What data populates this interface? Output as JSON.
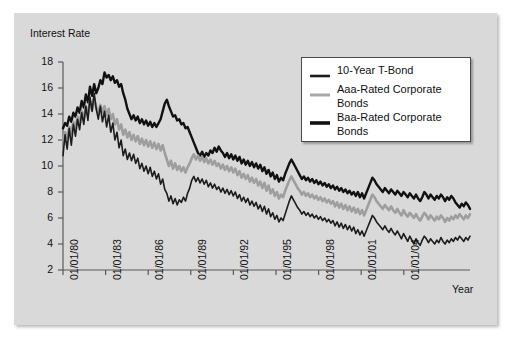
{
  "chart_data": {
    "type": "line",
    "title": "",
    "xlabel": "Year",
    "ylabel": "Interest Rate",
    "ylim": [
      2,
      18
    ],
    "yticks": [
      2,
      4,
      6,
      8,
      10,
      12,
      14,
      16,
      18
    ],
    "xticks": [
      "01/01/80",
      "01/01/83",
      "01/01/86",
      "01/01/89",
      "01/01/92",
      "01/01/95",
      "01/01/98",
      "01/01/01",
      "01/01/04"
    ],
    "xlim": [
      "01/01/80",
      "01/01/06"
    ],
    "grid": false,
    "legend_position": "upper-right-inside",
    "colors": {
      "t_bond": "#1c1c1c",
      "aaa": "#9e9e9e",
      "baa": "#111111",
      "panel_background": "#d9d9d9",
      "page_background": "#ffffff",
      "axis": "#5a5a5a"
    },
    "series": [
      {
        "name": "10-Year T-Bond",
        "color": "#1c1c1c",
        "width": 1.6,
        "values": [
          10.8,
          12.4,
          11.3,
          12.9,
          11.6,
          13.2,
          12.3,
          13.6,
          12.8,
          14.1,
          13.2,
          14.6,
          13.5,
          15.3,
          14.2,
          15.6,
          14.4,
          13.6,
          14.6,
          13.4,
          14.2,
          13.0,
          13.9,
          12.6,
          13.3,
          12.0,
          12.6,
          11.4,
          12.0,
          10.8,
          11.3,
          10.5,
          11.0,
          10.4,
          10.9,
          10.2,
          10.6,
          9.8,
          10.2,
          9.6,
          10.0,
          9.4,
          9.9,
          9.2,
          9.6,
          9.0,
          9.4,
          8.6,
          9.0,
          8.2,
          7.9,
          7.3,
          7.7,
          7.1,
          7.5,
          7.0,
          7.4,
          7.2,
          7.6,
          7.3,
          7.9,
          8.3,
          8.9,
          9.2,
          8.8,
          9.1,
          8.7,
          9.0,
          8.6,
          8.9,
          8.4,
          8.7,
          8.3,
          8.6,
          8.2,
          8.4,
          8.0,
          8.3,
          7.9,
          8.2,
          7.8,
          8.1,
          7.7,
          8.0,
          7.5,
          7.8,
          7.3,
          7.6,
          7.2,
          7.5,
          7.0,
          7.3,
          6.9,
          7.2,
          6.7,
          7.0,
          6.5,
          6.9,
          6.3,
          6.7,
          6.1,
          6.4,
          5.9,
          6.2,
          5.7,
          6.0,
          5.8,
          6.3,
          6.8,
          7.3,
          7.7,
          7.4,
          7.1,
          6.8,
          6.6,
          6.3,
          6.5,
          6.2,
          6.4,
          6.1,
          6.3,
          6.0,
          6.2,
          5.9,
          6.1,
          5.8,
          6.0,
          5.7,
          5.9,
          5.6,
          5.8,
          5.4,
          5.7,
          5.3,
          5.6,
          5.2,
          5.5,
          5.1,
          5.4,
          5.0,
          5.3,
          4.8,
          5.1,
          4.7,
          5.0,
          4.6,
          5.0,
          5.4,
          5.8,
          6.2,
          6.0,
          5.7,
          5.5,
          5.3,
          5.1,
          5.4,
          5.1,
          4.9,
          5.2,
          4.9,
          4.7,
          5.0,
          4.7,
          4.4,
          4.8,
          4.5,
          4.2,
          4.6,
          4.3,
          4.0,
          4.4,
          4.1,
          3.9,
          4.3,
          4.6,
          4.4,
          4.1,
          4.4,
          4.2,
          4.0,
          4.3,
          4.1,
          4.5,
          4.2,
          4.0,
          4.3,
          4.1,
          4.4,
          4.2,
          4.5,
          4.3,
          4.6,
          4.4,
          4.2,
          4.5,
          4.3,
          4.6
        ]
      },
      {
        "name": "Aaa-Rated Corporate Bonds",
        "color": "#9e9e9e",
        "width": 2.6,
        "values": [
          11.9,
          12.6,
          12.2,
          13.0,
          12.5,
          13.4,
          12.9,
          13.8,
          13.2,
          14.2,
          13.6,
          14.6,
          13.9,
          15.0,
          14.3,
          15.2,
          14.5,
          14.0,
          14.7,
          14.1,
          14.6,
          13.9,
          14.4,
          13.6,
          14.0,
          13.2,
          13.6,
          12.8,
          13.2,
          12.4,
          12.8,
          12.2,
          12.6,
          12.0,
          12.4,
          11.9,
          12.3,
          11.7,
          12.1,
          11.6,
          12.0,
          11.5,
          11.9,
          11.4,
          11.8,
          11.3,
          11.7,
          11.2,
          11.6,
          11.0,
          10.5,
          10.0,
          10.4,
          9.8,
          10.2,
          9.7,
          10.0,
          9.6,
          9.9,
          9.5,
          9.9,
          10.2,
          10.6,
          10.9,
          10.5,
          10.8,
          10.4,
          10.7,
          10.3,
          10.6,
          10.2,
          10.5,
          10.1,
          10.4,
          10.0,
          10.2,
          9.8,
          10.1,
          9.7,
          10.0,
          9.6,
          9.9,
          9.5,
          9.8,
          9.3,
          9.6,
          9.1,
          9.4,
          9.0,
          9.3,
          8.8,
          9.1,
          8.7,
          9.0,
          8.5,
          8.8,
          8.3,
          8.7,
          8.1,
          8.5,
          7.9,
          8.2,
          7.7,
          8.0,
          7.5,
          7.8,
          7.6,
          8.1,
          8.5,
          8.9,
          9.2,
          8.9,
          8.6,
          8.3,
          8.1,
          7.8,
          8.0,
          7.7,
          7.9,
          7.6,
          7.8,
          7.5,
          7.7,
          7.4,
          7.6,
          7.3,
          7.5,
          7.2,
          7.4,
          7.1,
          7.3,
          6.9,
          7.2,
          6.8,
          7.1,
          6.7,
          7.0,
          6.6,
          6.9,
          6.5,
          6.8,
          6.4,
          6.7,
          6.3,
          6.6,
          6.2,
          6.6,
          7.0,
          7.4,
          7.8,
          7.6,
          7.3,
          7.1,
          6.9,
          6.7,
          7.0,
          6.8,
          6.6,
          6.9,
          6.6,
          6.4,
          6.7,
          6.4,
          6.2,
          6.6,
          6.3,
          6.1,
          6.4,
          6.2,
          6.0,
          6.3,
          6.0,
          5.8,
          6.1,
          6.4,
          6.2,
          5.9,
          6.2,
          6.0,
          5.8,
          6.1,
          5.9,
          6.2,
          6.0,
          5.7,
          6.0,
          5.8,
          6.1,
          5.9,
          6.2,
          6.0,
          6.3,
          6.1,
          5.9,
          6.2,
          6.0,
          6.3
        ]
      },
      {
        "name": "Baa-Rated Corporate Bonds",
        "color": "#111111",
        "width": 2.4,
        "values": [
          12.9,
          13.3,
          13.1,
          13.8,
          13.4,
          14.1,
          13.8,
          14.5,
          14.1,
          15.0,
          14.5,
          15.5,
          14.9,
          16.1,
          15.4,
          16.3,
          15.6,
          16.0,
          16.6,
          16.3,
          17.2,
          16.8,
          17.0,
          16.6,
          16.9,
          16.4,
          16.6,
          16.1,
          16.3,
          15.6,
          15.1,
          14.4,
          14.0,
          13.6,
          13.9,
          13.5,
          13.8,
          13.3,
          13.6,
          13.2,
          13.5,
          13.1,
          13.4,
          13.0,
          13.3,
          13.0,
          13.3,
          13.6,
          14.2,
          14.8,
          15.1,
          14.6,
          14.2,
          13.8,
          13.9,
          13.5,
          13.6,
          13.2,
          13.3,
          12.9,
          13.0,
          12.6,
          12.2,
          11.8,
          11.4,
          11.0,
          10.8,
          11.1,
          10.7,
          11.0,
          10.8,
          11.2,
          11.0,
          11.4,
          11.1,
          11.5,
          11.2,
          11.0,
          10.7,
          11.0,
          10.6,
          10.9,
          10.5,
          10.8,
          10.4,
          10.7,
          10.2,
          10.5,
          10.1,
          10.4,
          10.0,
          10.3,
          9.9,
          10.2,
          9.8,
          10.1,
          9.6,
          9.9,
          9.4,
          9.7,
          9.2,
          9.5,
          9.0,
          9.3,
          8.8,
          9.1,
          8.9,
          9.4,
          9.8,
          10.2,
          10.5,
          10.2,
          9.9,
          9.6,
          9.3,
          9.0,
          9.2,
          8.9,
          9.1,
          8.8,
          9.0,
          8.7,
          8.9,
          8.6,
          8.8,
          8.5,
          8.7,
          8.4,
          8.6,
          8.3,
          8.5,
          8.2,
          8.4,
          8.1,
          8.3,
          8.0,
          8.2,
          7.9,
          8.1,
          7.8,
          8.0,
          7.7,
          8.0,
          7.6,
          7.9,
          7.5,
          7.9,
          8.3,
          8.7,
          9.1,
          8.9,
          8.6,
          8.4,
          8.2,
          8.0,
          8.3,
          8.1,
          7.9,
          8.2,
          8.0,
          7.8,
          8.1,
          7.9,
          7.7,
          8.0,
          7.8,
          7.6,
          7.9,
          7.7,
          7.5,
          7.8,
          7.5,
          7.3,
          7.6,
          8.0,
          7.8,
          7.5,
          7.8,
          7.6,
          7.4,
          7.7,
          7.5,
          7.8,
          7.6,
          7.3,
          7.6,
          7.4,
          7.7,
          7.5,
          7.2,
          7.0,
          6.8,
          7.1,
          6.9,
          7.2,
          7.0,
          6.7
        ]
      }
    ]
  },
  "legend": {
    "items": [
      {
        "label": "10-Year T-Bond"
      },
      {
        "label": "Aaa-Rated Corporate\nBonds"
      },
      {
        "label": "Baa-Rated Corporate\nBonds"
      }
    ]
  }
}
